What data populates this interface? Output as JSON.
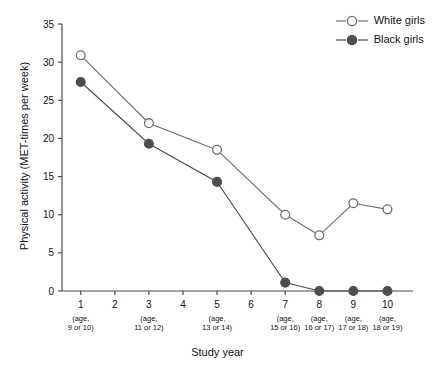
{
  "chart_data": {
    "type": "line",
    "title": "",
    "xlabel": "Study year",
    "ylabel": "Physical activity (MET-times per week)",
    "x": [
      1,
      3,
      5,
      7,
      8,
      9,
      10
    ],
    "xticks": [
      1,
      2,
      3,
      4,
      5,
      6,
      7,
      8,
      9,
      10
    ],
    "xlim": [
      0.45,
      10.75
    ],
    "ylim": [
      0,
      35
    ],
    "yticks": [
      0,
      5,
      10,
      15,
      20,
      25,
      30,
      35
    ],
    "grid": false,
    "legend_position": "top-right",
    "x_sub_labels": [
      {
        "year": 1,
        "line1": "(age,",
        "line2": "9 or 10)"
      },
      {
        "year": 3,
        "line1": "(age,",
        "line2": "11 or 12)"
      },
      {
        "year": 5,
        "line1": "(age,",
        "line2": "13 or 14)"
      },
      {
        "year": 7,
        "line1": "(age,",
        "line2": "15 or 16)"
      },
      {
        "year": 8,
        "line1": "(age,",
        "line2": "16 or 17)"
      },
      {
        "year": 9,
        "line1": "(age,",
        "line2": "17 or 18)"
      },
      {
        "year": 10,
        "line1": "(age,",
        "line2": "18 or 19)"
      }
    ],
    "series": [
      {
        "name": "White girls",
        "marker": "open-circle",
        "color": "#6e6e6e",
        "fill": "#ffffff",
        "values": [
          30.9,
          22.0,
          18.5,
          10.0,
          7.3,
          11.5,
          10.7
        ]
      },
      {
        "name": "Black girls",
        "marker": "filled-circle",
        "color": "#4d4d4d",
        "fill": "#4d4d4d",
        "values": [
          27.4,
          19.3,
          14.3,
          1.1,
          0.0,
          0.0,
          0.0
        ]
      }
    ]
  },
  "legend": {
    "items": [
      {
        "label": "White girls"
      },
      {
        "label": "Black girls"
      }
    ]
  },
  "axes": {
    "x_title": "Study year",
    "y_title": "Physical activity (MET-times per week)"
  }
}
